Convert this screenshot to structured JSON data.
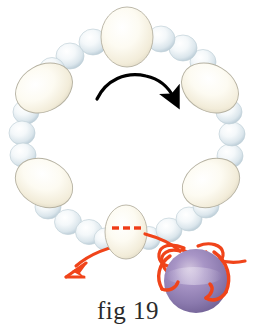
{
  "figure": {
    "caption": "fig 19",
    "background_color": "#ffffff"
  },
  "colors": {
    "small_bead_fill": "#f2f6f8",
    "small_bead_shade": "#c3d2da",
    "small_bead_highlight": "#ffffff",
    "large_bead_fill": "#fbf8ec",
    "large_bead_shade": "#ded8c4",
    "large_bead_outline": "#b9b5a6",
    "purple_bead_fill": "#8b7aae",
    "purple_bead_highlight": "#cbbcd9",
    "purple_bead_shade": "#6d5d92",
    "cord_red": "#f0441a",
    "dashed_red": "#ef3c17",
    "black_arrow": "#000000"
  },
  "necklace": {
    "center_x": 127,
    "center_y": 128,
    "radius_x": 104,
    "radius_y": 112,
    "large_beads": [
      {
        "name": "top-large-bead",
        "cx": 127,
        "cy": 36,
        "rx": 26,
        "ry": 30,
        "rotate": 0
      },
      {
        "name": "upper-left-large-bead",
        "cx": 42,
        "cy": 87,
        "rx": 29,
        "ry": 23,
        "rotate": -28
      },
      {
        "name": "upper-right-large-bead",
        "cx": 210,
        "cy": 87,
        "rx": 29,
        "ry": 23,
        "rotate": 28
      },
      {
        "name": "lower-left-large-bead",
        "cx": 42,
        "cy": 184,
        "rx": 29,
        "ry": 23,
        "rotate": 26
      },
      {
        "name": "lower-right-large-bead",
        "cx": 211,
        "cy": 184,
        "rx": 29,
        "ry": 23,
        "rotate": -26
      },
      {
        "name": "bottom-clasp-bead",
        "cx": 126,
        "cy": 232,
        "rx": 21,
        "ry": 26,
        "rotate": 0
      }
    ],
    "small_bead_count": 22,
    "small_bead_radius": 13
  },
  "annotations": {
    "rotation_arrow": {
      "name": "rotation-direction-arrow",
      "color": "#000000",
      "direction": "clockwise",
      "description": "black curved arrow across center pointing right-down"
    },
    "pull_arrow": {
      "name": "pull-direction-arrow",
      "color": "#f0441a",
      "direction": "down-left",
      "description": "red curved arrow leaving the clasp bead toward lower left"
    },
    "dashed_cord": {
      "name": "hidden-cord-dashes",
      "color": "#ef3c17",
      "dash_count": 3,
      "description": "red dashed line showing cord hidden inside the clasp bead"
    },
    "knot": {
      "name": "cord-knot",
      "color": "#f0441a",
      "description": "red cord forming an overhand knot that loops around the purple bead"
    },
    "purple_bead": {
      "name": "purple-focus-bead",
      "cx": 196,
      "cy": 280,
      "r": 32,
      "fill": "#8b7aae"
    }
  }
}
